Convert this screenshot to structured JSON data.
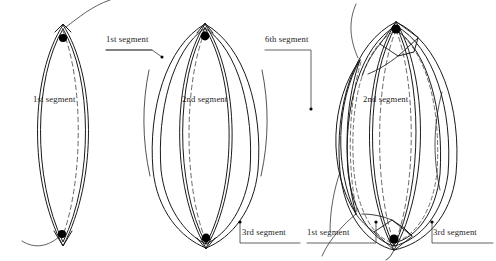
{
  "figure": {
    "type": "technical-line-drawing",
    "background_color": "#ffffff",
    "stroke_color": "#1a1a1a",
    "dashed_stroke_color": "#555555",
    "text_color": "#1d1d1d",
    "panels": [
      {
        "name": "panel-one-segment",
        "order": 1,
        "segments_shown": 1
      },
      {
        "name": "panel-three-segments",
        "order": 2,
        "segments_shown": 3
      },
      {
        "name": "panel-six-segments",
        "order": 3,
        "segments_shown": 6
      }
    ]
  },
  "labels": [
    {
      "id": "l1",
      "text": "1st segment",
      "x": 33,
      "y": 99,
      "leader": "none",
      "panel": 1
    },
    {
      "id": "l2",
      "text": "1st segment",
      "x": 106,
      "y": 39,
      "leader": "underline-right",
      "panel": 2
    },
    {
      "id": "l3",
      "text": "2nd segment",
      "x": 182,
      "y": 99,
      "leader": "none",
      "panel": 2
    },
    {
      "id": "l4",
      "text": "3rd segment",
      "x": 242,
      "y": 232,
      "leader": "elbow-up-left",
      "panel": 2
    },
    {
      "id": "l5",
      "text": "6th segment",
      "x": 265,
      "y": 39,
      "leader": "elbow-down-right",
      "panel": 3
    },
    {
      "id": "l6",
      "text": "2nd segment",
      "x": 363,
      "y": 99,
      "leader": "none",
      "panel": 3
    },
    {
      "id": "l7",
      "text": "1st segment",
      "x": 307,
      "y": 232,
      "leader": "underline-elbow-right",
      "panel": 3
    },
    {
      "id": "l8",
      "text": "3rd segment",
      "x": 433,
      "y": 232,
      "leader": "underline-elbow-left",
      "panel": 3
    }
  ],
  "markers": {
    "large_dots": [
      {
        "name": "apex-dot-top-panel1",
        "x": 63,
        "y": 38,
        "r": 4.1
      },
      {
        "name": "apex-dot-bottom-panel1",
        "x": 62,
        "y": 234,
        "r": 4.1
      },
      {
        "name": "apex-dot-top-panel2",
        "x": 205,
        "y": 36,
        "r": 4.4
      },
      {
        "name": "apex-dot-bottom-panel2",
        "x": 206,
        "y": 238,
        "r": 4.4
      },
      {
        "name": "apex-dot-top-panel3",
        "x": 396,
        "y": 29,
        "r": 4.6
      },
      {
        "name": "apex-dot-bottom-panel3",
        "x": 394,
        "y": 239,
        "r": 4.6
      }
    ],
    "small_dots": [
      {
        "name": "leader-dot-1st-segment-panel2",
        "x": 162,
        "y": 57,
        "r": 1.5
      },
      {
        "name": "leader-dot-6th-segment-panel3",
        "x": 311,
        "y": 109,
        "r": 1.6
      },
      {
        "name": "leader-dot-3rd-segment-panel2",
        "x": 240,
        "y": 222,
        "r": 1.6
      },
      {
        "name": "leader-dot-1st-segment-panel3",
        "x": 376,
        "y": 222,
        "r": 1.6
      },
      {
        "name": "leader-dot-3rd-segment-panel3",
        "x": 432,
        "y": 222,
        "r": 1.6
      }
    ]
  }
}
